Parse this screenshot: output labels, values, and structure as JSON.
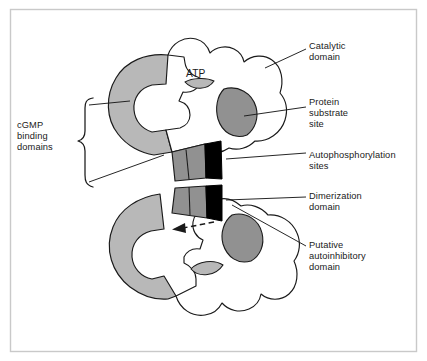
{
  "figure": {
    "title_labels": {
      "atp": "ATP",
      "cgmp_binding_domains": "cGMP\nbinding\ndomains",
      "catalytic_domain": "Catalytic\ndomain",
      "protein_substrate_site": "Protein\nsubstrate\nsite",
      "autophosphorylation_sites": "Autophosphorylation\nsites",
      "dimerization_domain": "Dimerization\ndomain",
      "putative_autoinhibitory_domain": "Putative\nautoinhibitory\ndomain"
    },
    "colors": {
      "background": "#ffffff",
      "frame_border": "#c8c8c8",
      "outline": "#1a1a1a",
      "light_gray_region": "#b8b8b8",
      "medium_gray_region": "#919191",
      "black_region": "#000000",
      "label_text": "#1a1a1a"
    },
    "structure": {
      "monomer_count": 2,
      "arrangement": "antiparallel head-to-tail dimer",
      "regions": [
        "cGMP binding domains (light gray C-shaped arm)",
        "Catalytic domain (white lobed body)",
        "Protein substrate site (medium gray oval)",
        "Autophosphorylation sites (black block)",
        "Dimerization domain (medium gray tail)",
        "ATP (light gray lens in catalytic cleft)"
      ],
      "arrow": "dashed arrow from autoinhibitory region into catalytic cleft"
    }
  }
}
